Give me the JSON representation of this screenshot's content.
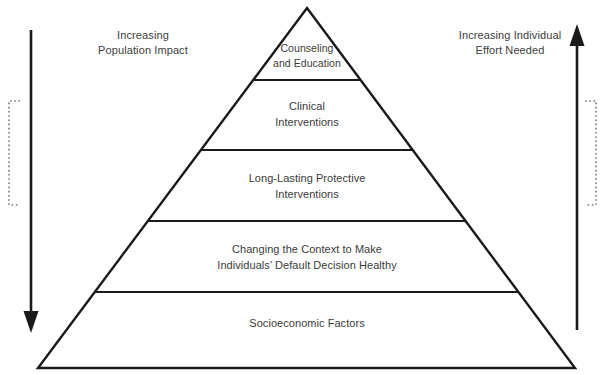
{
  "figure": {
    "kind": "health-impact-pyramid",
    "background_color": "#ffffff",
    "stroke_color": "#1a1a1a",
    "text_color": "#3a3a3a"
  },
  "axes": {
    "left": {
      "label": "Increasing\nPopulation Impact",
      "arrow_direction": "down",
      "bracket": "open-right-dotted"
    },
    "right": {
      "label": "Increasing Individual\nEffort Needed",
      "arrow_direction": "up",
      "bracket": "open-left-dotted"
    }
  },
  "pyramid": {
    "tiers": [
      {
        "index": 0,
        "label": "Counseling\nand Education"
      },
      {
        "index": 1,
        "label": "Clinical\nInterventions"
      },
      {
        "index": 2,
        "label": "Long-Lasting Protective\nInterventions"
      },
      {
        "index": 3,
        "label": "Changing the Context to Make\nIndividuals’ Default Decision Healthy"
      },
      {
        "index": 4,
        "label": "Socioeconomic Factors"
      }
    ]
  }
}
